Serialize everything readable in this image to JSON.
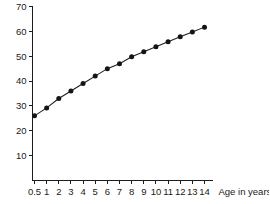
{
  "chart_data": {
    "type": "line",
    "title": "",
    "subtitle": "",
    "xlabel": "Age in years",
    "ylabel": "",
    "xlim": [
      0,
      14.6
    ],
    "ylim": [
      0,
      70
    ],
    "grid": false,
    "legend": false,
    "legend_position": "none",
    "marker": "filled-circle",
    "x_tick_labels": [
      "0.5",
      "1",
      "2",
      "3",
      "4",
      "5",
      "6",
      "7",
      "8",
      "9",
      "10",
      "11",
      "12",
      "13",
      "14"
    ],
    "x_tick_values": [
      0.5,
      1,
      2,
      3,
      4,
      5,
      6,
      7,
      8,
      9,
      10,
      11,
      12,
      13,
      14
    ],
    "y_tick_labels": [
      "10",
      "20",
      "30",
      "40",
      "50",
      "60",
      "70"
    ],
    "y_tick_values": [
      10,
      20,
      30,
      40,
      50,
      60,
      70
    ],
    "x": [
      0.5,
      1,
      2,
      3,
      4,
      5,
      6,
      7,
      8,
      9,
      10,
      11,
      12,
      13,
      14
    ],
    "values": [
      26,
      29.2,
      33,
      36,
      39,
      42,
      45,
      47,
      49.8,
      51.8,
      53.8,
      55.8,
      57.8,
      59.7,
      61.7
    ],
    "series": [
      {
        "name": "",
        "values": [
          26,
          29.2,
          33,
          36,
          39,
          42,
          45,
          47,
          49.8,
          51.8,
          53.8,
          55.8,
          57.8,
          59.7,
          61.7
        ]
      }
    ],
    "annotations": []
  },
  "axes": {
    "x_axis_title": "Age in years"
  },
  "colors": {
    "line": "#1d1d1d",
    "marker": "#141414",
    "axis": "#1d1d1d",
    "background": "#ffffff",
    "text": "#1a1a1a"
  }
}
